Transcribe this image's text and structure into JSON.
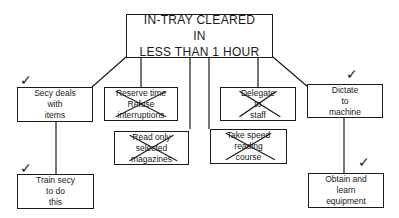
{
  "root": {
    "label": "IN-TRAY CLEARED\nIN\nLESS THAN 1 HOUR"
  },
  "nodes": [
    {
      "id": "secy-deals",
      "label": "Secy deals\nwith\nitems",
      "status": "accepted",
      "mark": "✓"
    },
    {
      "id": "reserve-time",
      "label": "Reserve time\nRefuse\ninterruptions",
      "status": "rejected"
    },
    {
      "id": "read-only",
      "label": "Read only\nselected\nmagazines",
      "status": "rejected"
    },
    {
      "id": "delegate",
      "label": "Delegate\nto\nstaff",
      "status": "rejected"
    },
    {
      "id": "speed-reading",
      "label": "Take speed\nreading\ncourse",
      "status": "rejected"
    },
    {
      "id": "dictate",
      "label": "Dictate\nto\nmachine",
      "status": "accepted",
      "mark": "✓"
    },
    {
      "id": "train-secy",
      "label": "Train secy\nto do\nthis",
      "status": "accepted",
      "mark": "✓"
    },
    {
      "id": "obtain-equipment",
      "label": "Obtain and\nlearn\nequipment",
      "status": "accepted",
      "mark": "✓"
    }
  ]
}
